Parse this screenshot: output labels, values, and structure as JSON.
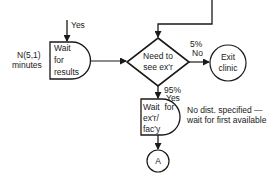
{
  "diagram": {
    "type": "flowchart",
    "nodes": {
      "wait_results": {
        "shape": "delay",
        "lines": [
          "Wait",
          "for",
          "results"
        ]
      },
      "decision": {
        "shape": "diamond",
        "lines": [
          "Need to",
          "see ex'r"
        ]
      },
      "exit": {
        "shape": "circle",
        "lines": [
          "Exit",
          "clinic"
        ]
      },
      "wait_examiner": {
        "shape": "delay",
        "lines": [
          "Wait  for",
          "ex'r/",
          "fac'y"
        ]
      },
      "connector_a": {
        "shape": "circle",
        "label": "A"
      }
    },
    "annotations": {
      "incoming_yes": "Yes",
      "distribution": [
        "N(5,1)",
        "minutes"
      ],
      "no_branch": [
        "5%",
        "No"
      ],
      "yes_branch": [
        "95%",
        "Yes"
      ],
      "note": [
        "No dist. specified —",
        "wait for first available"
      ]
    },
    "colors": {
      "stroke": "#1a1a1a",
      "background": "#ffffff"
    }
  }
}
